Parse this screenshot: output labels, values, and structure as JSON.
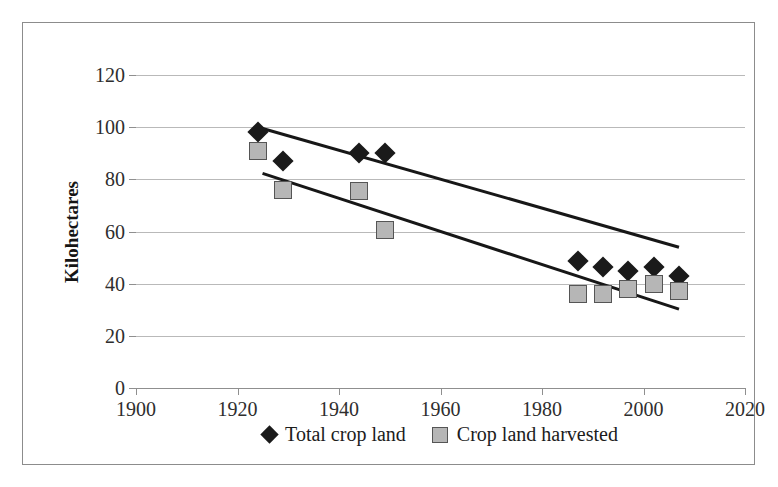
{
  "chart_data": {
    "type": "scatter",
    "title": "",
    "xlabel": "",
    "ylabel": "Kilohectares",
    "xlim": [
      1900,
      2020
    ],
    "ylim": [
      0,
      120
    ],
    "xticks": [
      1900,
      1920,
      1940,
      1960,
      1980,
      2000,
      2020
    ],
    "yticks": [
      0,
      20,
      40,
      60,
      80,
      100,
      120
    ],
    "grid": "horizontal",
    "legend_position": "bottom-center",
    "series": [
      {
        "name": "Total crop land",
        "marker": "diamond",
        "color": "#1a1a1a",
        "x": [
          1924,
          1929,
          1944,
          1949,
          1987,
          1992,
          1997,
          2002,
          2007
        ],
        "values": [
          98,
          87,
          90,
          90,
          48.5,
          46.5,
          45,
          46.5,
          43
        ]
      },
      {
        "name": "Crop land harvested",
        "marker": "square",
        "color": "#b6b6b6",
        "x": [
          1924,
          1929,
          1944,
          1949,
          1987,
          1992,
          1997,
          2002,
          2007
        ],
        "values": [
          91,
          76,
          75.5,
          60.5,
          36,
          36,
          38,
          40,
          37
        ]
      }
    ],
    "trendlines": [
      {
        "name": "Total crop land trend",
        "x": [
          1925,
          2007
        ],
        "y": [
          100,
          54.5
        ],
        "color": "#171717"
      },
      {
        "name": "Crop land harvested trend",
        "x": [
          1925,
          2007
        ],
        "y": [
          83,
          31
        ],
        "color": "#171717"
      }
    ]
  },
  "axes": {
    "y_label": "Kilohectares",
    "y_ticks": [
      "0",
      "20",
      "40",
      "60",
      "80",
      "100",
      "120"
    ],
    "x_ticks": [
      "1900",
      "1920",
      "1940",
      "1960",
      "1980",
      "2000",
      "2020"
    ]
  },
  "legend": {
    "entries": [
      {
        "label": "Total crop land",
        "marker": "diamond-marker-icon"
      },
      {
        "label": "Crop land harvested",
        "marker": "square-marker-icon"
      }
    ]
  }
}
